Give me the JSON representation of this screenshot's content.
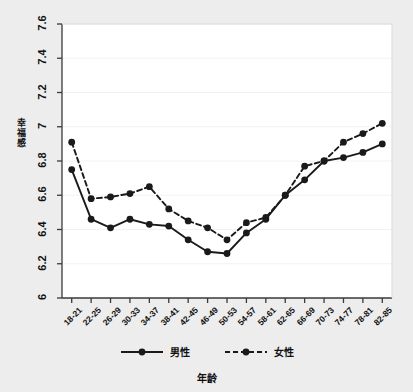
{
  "chart_data": {
    "type": "line",
    "title": "",
    "xlabel": "年龄",
    "ylabel": "幸福感",
    "categories": [
      "18-21",
      "22-25",
      "26-29",
      "30-33",
      "34-37",
      "38-41",
      "42-45",
      "46-49",
      "50-53",
      "54-57",
      "58-61",
      "62-65",
      "66-69",
      "70-73",
      "74-77",
      "78-81",
      "82-85"
    ],
    "ylim": [
      6,
      7.6
    ],
    "yticks": [
      "6",
      "6.2",
      "6.4",
      "6.6",
      "6.8",
      "7",
      "7.2",
      "7.4",
      "7.6"
    ],
    "ytick_values": [
      6,
      6.2,
      6.4,
      6.6,
      6.8,
      7,
      7.2,
      7.4,
      7.6
    ],
    "grid": true,
    "legend_position": "bottom",
    "series": [
      {
        "name": "男性",
        "style": "solid",
        "color": "#1a1a1a",
        "values": [
          6.75,
          6.46,
          6.41,
          6.46,
          6.43,
          6.42,
          6.34,
          6.27,
          6.26,
          6.38,
          6.46,
          6.6,
          6.69,
          6.8,
          6.82,
          6.85,
          6.9
        ]
      },
      {
        "name": "女性",
        "style": "dashed",
        "color": "#1a1a1a",
        "values": [
          6.91,
          6.58,
          6.59,
          6.61,
          6.65,
          6.52,
          6.45,
          6.41,
          6.34,
          6.44,
          6.47,
          6.6,
          6.77,
          6.8,
          6.91,
          6.96,
          7.02
        ]
      }
    ]
  },
  "legend": {
    "items": [
      {
        "label": "男性",
        "style": "solid"
      },
      {
        "label": "女性",
        "style": "dashed"
      }
    ]
  }
}
